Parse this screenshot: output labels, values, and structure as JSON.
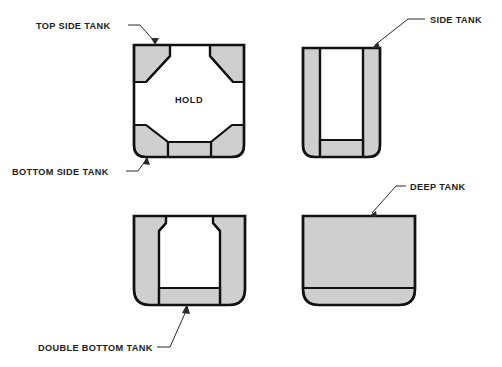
{
  "figure": {
    "background_color": "#ffffff",
    "line_color": "#111111",
    "tank_fill_color": "#cfcfcf",
    "label_color": "#1c1c1c"
  },
  "labels": {
    "top_side_tank": "TOP SIDE TANK",
    "bottom_side_tank": "BOTTOM SIDE TANK",
    "side_tank": "SIDE TANK",
    "deep_tank": "DEEP TANK",
    "double_bottom_tank": "DOUBLE BOTTOM TANK",
    "hold": "HOLD"
  },
  "panels": [
    {
      "id": "panel-top-left",
      "name": "topside-and-bottomside-tank-section",
      "callouts": [
        "TOP SIDE TANK",
        "BOTTOM SIDE TANK"
      ],
      "interior_label": "HOLD",
      "tanks": [
        "top side tank (port)",
        "top side tank (starboard)",
        "bottom side tank (port)",
        "bottom side tank (starboard)",
        "double bottom"
      ]
    },
    {
      "id": "panel-top-right",
      "name": "side-tank-section",
      "callouts": [
        "SIDE TANK"
      ],
      "interior_label": "",
      "tanks": [
        "side tank (port)",
        "side tank (starboard)",
        "double bottom"
      ]
    },
    {
      "id": "panel-bottom-left",
      "name": "double-bottom-tank-section",
      "callouts": [
        "DOUBLE BOTTOM TANK"
      ],
      "interior_label": "",
      "tanks": [
        "wing tank (port)",
        "wing tank (starboard)",
        "double bottom tank"
      ]
    },
    {
      "id": "panel-bottom-right",
      "name": "deep-tank-section",
      "callouts": [
        "DEEP TANK"
      ],
      "interior_label": "",
      "tanks": [
        "deep tank (full section)"
      ]
    }
  ]
}
